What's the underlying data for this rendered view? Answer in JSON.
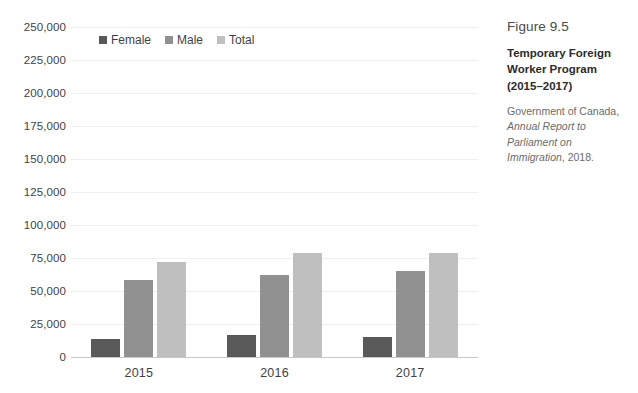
{
  "caption": {
    "figure_number": "Figure 9.5",
    "title": "Temporary Foreign Worker Program (2015–2017)",
    "source_prefix": "Government of Canada,",
    "source_italic": "Annual Report to Parliament on Immigration",
    "source_suffix": ", 2018."
  },
  "colors": {
    "female": "#595959",
    "male": "#919191",
    "total": "#bfbfbf",
    "gridline": "#efefef",
    "axis": "#c8c8c8",
    "text": "#3f3f3f"
  },
  "chart_data": {
    "type": "bar",
    "title": "Temporary Foreign Worker Program (2015–2017)",
    "xlabel": "",
    "ylabel": "",
    "categories": [
      "2015",
      "2016",
      "2017"
    ],
    "series": [
      {
        "name": "Female",
        "values": [
          14000,
          16500,
          15000
        ],
        "color": "#595959"
      },
      {
        "name": "Male",
        "values": [
          58000,
          62000,
          65000
        ],
        "color": "#919191"
      },
      {
        "name": "Total",
        "values": [
          72000,
          78500,
          79000
        ],
        "color": "#bfbfbf"
      }
    ],
    "ylim": [
      0,
      250000
    ],
    "ytick_step": 25000,
    "ytick_labels": [
      "250,000",
      "225,000",
      "200,000",
      "175,000",
      "150,000",
      "125,000",
      "100,000",
      "75,000",
      "50,000",
      "25,000",
      "0"
    ],
    "ytick_values": [
      250000,
      225000,
      200000,
      175000,
      150000,
      125000,
      100000,
      75000,
      50000,
      25000,
      0
    ],
    "grid": true,
    "legend": [
      "Female",
      "Male",
      "Total"
    ],
    "legend_position": "top-left-inside"
  }
}
